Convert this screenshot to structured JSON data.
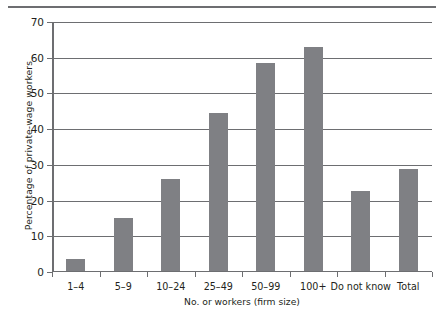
{
  "chart_data": {
    "type": "bar",
    "title": "",
    "xlabel": "No. or workers (firm size)",
    "ylabel": "Percentage of private-wage workers",
    "categories": [
      "1–4",
      "5–9",
      "10–24",
      "25–49",
      "50–99",
      "100+",
      "Do not know",
      "Total"
    ],
    "values": [
      3.1,
      14.8,
      25.7,
      44.0,
      58.0,
      62.5,
      22.2,
      28.5
    ],
    "ylim": [
      0,
      70
    ],
    "yticks": [
      0,
      10,
      20,
      30,
      40,
      50,
      60,
      70
    ],
    "ytick_labels": [
      "0",
      "10",
      "20",
      "30",
      "40",
      "50",
      "60",
      "70"
    ],
    "grid": "horizontal",
    "legend": "none",
    "bar_color": "#7f8084",
    "axis_color": "#6d6e71"
  }
}
